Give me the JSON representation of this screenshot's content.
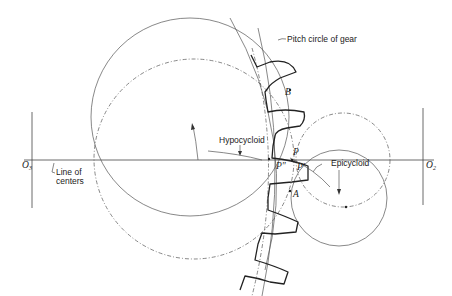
{
  "diagram": {
    "labels": {
      "pitch_circle": "Pitch circle of gear",
      "hypocycloid": "Hypocycloid",
      "epicycloid": "Epicycloid",
      "line_of_centers_1": "Line of",
      "line_of_centers_2": "centers",
      "point_B": "B",
      "point_P": "P",
      "point_P_double_prime": "P″",
      "point_P_prime": "P′",
      "point_A": "A",
      "center_left": "O",
      "center_left_sub": "3",
      "center_right": "O",
      "center_right_sub": "2"
    },
    "colors": {
      "line": "#555555",
      "tooth": "#222222",
      "background": "#ffffff"
    }
  }
}
